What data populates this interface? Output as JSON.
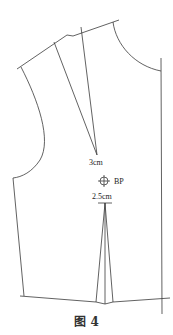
{
  "diagram": {
    "type": "bodice-front-pattern",
    "labels": {
      "shoulder_dart_note": "3cm",
      "bust_point": "BP",
      "waist_dart_note": "2.5cm"
    },
    "caption": "图 4",
    "colors": {
      "line": "#3a3a3a",
      "background": "#ffffff"
    }
  }
}
